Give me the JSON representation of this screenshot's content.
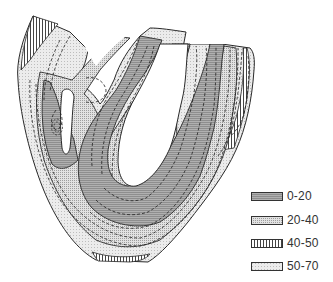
{
  "figure": {
    "type": "contour-map"
  },
  "legend": {
    "items": [
      {
        "label": "0-20",
        "pattern": "horizontal-lines-dark",
        "color": "#9a9a9a"
      },
      {
        "label": "20-40",
        "pattern": "dots",
        "color": "#d9d9d9"
      },
      {
        "label": "40-50",
        "pattern": "vertical-lines",
        "color": "#ffffff"
      },
      {
        "label": "50-70",
        "pattern": "fine-stipple-light",
        "color": "#e6e6e6"
      }
    ]
  },
  "colors": {
    "outline": "#2a2a2a",
    "zone_0_20": "#a6a6a6",
    "zone_20_40": "#d6d6d6",
    "zone_40_50": "#f2f2f2",
    "zone_50_70": "#e8e8e8"
  }
}
